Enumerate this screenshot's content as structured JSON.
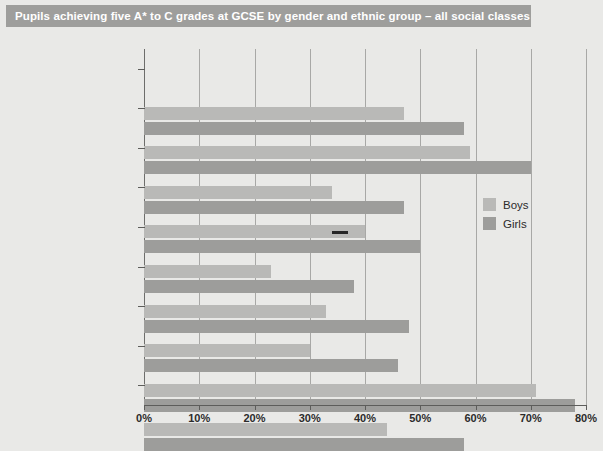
{
  "title": "Pupils achieving five A* to C grades at GCSE by gender and ethnic group – all social classes",
  "legend": {
    "boys_label": "Boys",
    "girls_label": "Girls"
  },
  "colors": {
    "boys": "#b9b9b7",
    "girls": "#9d9d9b",
    "title_bar": "#9e9e9c",
    "background": "#e9e9e7",
    "marker": "#262626"
  },
  "chart_data": {
    "type": "bar",
    "orientation": "horizontal",
    "title": "Pupils achieving five A* to C grades at GCSE by gender and ethnic group – all social classes",
    "xlabel": "",
    "ylabel": "",
    "xlim": [
      0,
      80
    ],
    "xticks": [
      0,
      10,
      20,
      30,
      40,
      50,
      60,
      70,
      80
    ],
    "xticklabels": [
      "0%",
      "10%",
      "20%",
      "30%",
      "40%",
      "50%",
      "60%",
      "70%",
      "80%"
    ],
    "grid": true,
    "legend_position": "center-right",
    "categories": [
      "White",
      "Indian",
      "Pakistani",
      "Bangladeshi",
      "Black Caribbean",
      "Black African",
      "Other Black",
      "Chinese",
      "Any other ethnic group"
    ],
    "series": [
      {
        "name": "Boys",
        "values": [
          47,
          59,
          34,
          40,
          23,
          33,
          30,
          71,
          44
        ]
      },
      {
        "name": "Girls",
        "values": [
          58,
          70,
          47,
          50,
          38,
          48,
          46,
          78,
          58
        ]
      }
    ],
    "annotations": [
      {
        "type": "marker-line",
        "category": "Bangladeshi",
        "series": "Boys",
        "from": 34,
        "to": 37
      }
    ]
  }
}
